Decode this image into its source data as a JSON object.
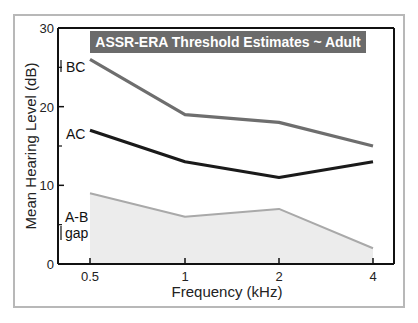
{
  "chart_data": {
    "type": "line",
    "title": "ASSR-ERA Threshold Estimates ~ Adult",
    "xlabel": "Frequency (kHz)",
    "ylabel": "Mean Hearing Level (dB)",
    "categories": [
      "0.5",
      "1",
      "2",
      "4"
    ],
    "ylim": [
      0,
      30
    ],
    "yticks": [
      0,
      10,
      20,
      30
    ],
    "yticks_minor": [
      5,
      15,
      25
    ],
    "grid": false,
    "series": [
      {
        "name": "BC",
        "values": [
          26,
          19,
          18,
          15
        ],
        "color": "#6e6e6e"
      },
      {
        "name": "AC",
        "values": [
          17,
          13,
          11,
          13
        ],
        "color": "#1a1a1a"
      },
      {
        "name": "A-B gap",
        "values": [
          9,
          6,
          7,
          2
        ],
        "color": "#a9a9a9",
        "fill": "#ececec",
        "area": true
      }
    ],
    "labels": {
      "bc": "BC",
      "ac": "AC",
      "gap_line1": "A-B",
      "gap_line2": "gap"
    },
    "title_bg": "#6b6b6b"
  }
}
